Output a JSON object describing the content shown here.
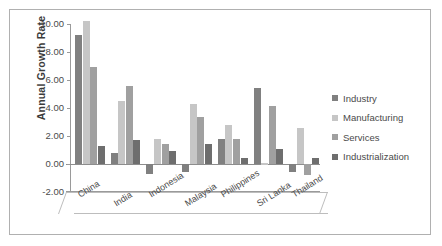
{
  "chart_data": {
    "type": "bar",
    "title": "",
    "xlabel": "",
    "ylabel": "Annual Growth Rate",
    "ylim": [
      -2.0,
      10.0
    ],
    "ytick_labels": [
      "10.00",
      "8.00",
      "6.00",
      "4.00",
      "2.00",
      "0.00",
      "-2.00"
    ],
    "ytick_values": [
      10,
      8,
      6,
      4,
      2,
      0,
      -2
    ],
    "grid": false,
    "legend_position": "right",
    "categories": [
      "China",
      "India",
      "Indonesia",
      "Malaysia",
      "Philippines",
      "Sri Lanka",
      "Thailand"
    ],
    "series": [
      {
        "name": "Industry",
        "color": "#808080",
        "values": [
          9.2,
          0.8,
          -0.7,
          -0.6,
          1.8,
          5.4,
          -0.6
        ]
      },
      {
        "name": "Manufacturing",
        "color": "#c6c6c6",
        "values": [
          10.2,
          4.5,
          1.8,
          4.3,
          2.8,
          0.05,
          2.55
        ]
      },
      {
        "name": "Services",
        "color": "#a0a0a0",
        "values": [
          6.9,
          5.6,
          1.45,
          3.35,
          1.8,
          4.15,
          -0.8
        ]
      },
      {
        "name": "Industrialization",
        "color": "#6e6e6e",
        "values": [
          1.3,
          1.7,
          0.95,
          1.4,
          0.4,
          1.1,
          0.4
        ]
      }
    ]
  },
  "legend": {
    "items": [
      {
        "label": "Industry",
        "color": "#808080"
      },
      {
        "label": "Manufacturing",
        "color": "#c6c6c6"
      },
      {
        "label": "Services",
        "color": "#a0a0a0"
      },
      {
        "label": "Industrialization",
        "color": "#6e6e6e"
      }
    ]
  },
  "axes": {
    "y_title": "Annual Growth Rate"
  }
}
